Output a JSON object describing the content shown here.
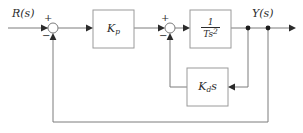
{
  "diagram": {
    "type": "control-system-block-diagram",
    "width": 303,
    "height": 133,
    "background_color": "#ffffff",
    "wire_color": "#7c7c7c",
    "text_color": "#2b2b2b",
    "block_border_color": "#9a9a9a"
  },
  "signals": {
    "input_label": "R(s)",
    "output_label": "Y(s)"
  },
  "blocks": [
    {
      "id": "kp",
      "label": "K_p",
      "label_main": "K",
      "label_sub": "p",
      "x": 93,
      "y": 10,
      "w": 41,
      "h": 38
    },
    {
      "id": "plant",
      "label": "1/(Ts^2)",
      "numerator": "1",
      "denominator_main": "Ts",
      "denominator_exp": "2",
      "x": 190,
      "y": 10,
      "w": 41,
      "h": 38
    },
    {
      "id": "kds",
      "label": "K_d s",
      "label_main": "K",
      "label_sub": "d",
      "label_tail": "s",
      "x": 187,
      "y": 68,
      "w": 41,
      "h": 38
    }
  ],
  "summing_junctions": [
    {
      "id": "sum1",
      "cx": 53,
      "cy": 28,
      "r": 5,
      "signs": [
        {
          "symbol": "+",
          "position": "top-left"
        },
        {
          "symbol": "−",
          "position": "bottom-left"
        }
      ]
    },
    {
      "id": "sum2",
      "cx": 170,
      "cy": 28,
      "r": 5,
      "signs": [
        {
          "symbol": "+",
          "position": "top-left"
        },
        {
          "symbol": "−",
          "position": "bottom-left"
        }
      ]
    }
  ],
  "junction_dots": [
    {
      "id": "tap-inner",
      "cx": 248,
      "cy": 28
    },
    {
      "id": "tap-outer",
      "cx": 268,
      "cy": 28
    }
  ],
  "paths": {
    "input_wire": "M 8 28 L 48 28",
    "sum1_to_kp": "M 58 28 L 93 28",
    "kp_to_sum2": "M 134 28 L 165 28",
    "sum2_to_plant": "M 175 28 L 190 28",
    "plant_to_output": "M 231 28 L 295 28",
    "inner_feedback": "M 248 28 L 248 87 L 228 87",
    "inner_return": "M 187 87 L 170 87 L 170 33",
    "outer_feedback": "M 268 28 L 268 122 L 53 122 L 53 33"
  },
  "arrowheads": [
    {
      "id": "into-sum1",
      "x": 48,
      "y": 28,
      "dir": "right"
    },
    {
      "id": "into-kp",
      "x": 93,
      "y": 28,
      "dir": "right"
    },
    {
      "id": "into-sum2",
      "x": 165,
      "y": 28,
      "dir": "right"
    },
    {
      "id": "into-plant",
      "x": 190,
      "y": 28,
      "dir": "right"
    },
    {
      "id": "output-end",
      "x": 295,
      "y": 28,
      "dir": "right"
    },
    {
      "id": "into-kds",
      "x": 228,
      "y": 87,
      "dir": "left"
    },
    {
      "id": "inner-into-sum2",
      "x": 170,
      "y": 33,
      "dir": "up"
    },
    {
      "id": "outer-into-sum1",
      "x": 53,
      "y": 33,
      "dir": "up"
    }
  ]
}
